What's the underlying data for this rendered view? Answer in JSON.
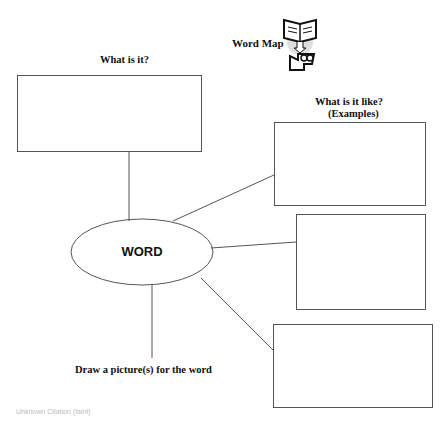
{
  "title": "Word Map",
  "labels": {
    "what_is_it": "What is it?",
    "what_is_it_like": "What is it like?",
    "examples": "(Examples)",
    "draw_picture": "Draw a picture(s) for the word"
  },
  "center_word": "WORD",
  "icon": "book-and-character-icon",
  "footer_text": "Unknown Citation (faint)",
  "colors": {
    "line": "#555555",
    "text": "#111111",
    "background": "#ffffff"
  }
}
